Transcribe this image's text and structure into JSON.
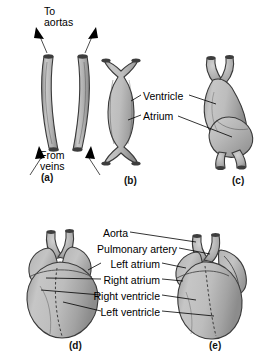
{
  "figure": {
    "type": "biology-diagram",
    "background_color": "#ffffff",
    "fill_light": "#cfcfcf",
    "fill_mid": "#b0b0b0",
    "fill_dark": "#8f8f8f",
    "outline_color": "#3a3a3a"
  },
  "panels": [
    {
      "id": "a",
      "label": "(a)",
      "caption_x": 48,
      "caption_y": 177
    },
    {
      "id": "b",
      "label": "(b)",
      "caption_x": 131,
      "caption_y": 180
    },
    {
      "id": "c",
      "label": "(c)",
      "caption_x": 239,
      "caption_y": 180
    },
    {
      "id": "d",
      "label": "(d)",
      "caption_x": 76,
      "caption_y": 345
    },
    {
      "id": "e",
      "label": "(e)",
      "caption_x": 216,
      "caption_y": 345
    }
  ],
  "panel_a": {
    "top_annotation": {
      "line1": "To",
      "line2": "aortas"
    },
    "bottom_annotation": {
      "line1": "From",
      "line2": "veins"
    }
  },
  "panel_bc_labels": [
    {
      "text": "Ventricle",
      "y": 98
    },
    {
      "text": "Atrium",
      "y": 118
    }
  ],
  "panel_de_labels": [
    {
      "text": "Aorta",
      "y": 234
    },
    {
      "text": "Pulmonary artery",
      "y": 250
    },
    {
      "text": "Left atrium",
      "y": 265
    },
    {
      "text": "Right atrium",
      "y": 281
    },
    {
      "text": "Right ventricle",
      "y": 297
    },
    {
      "text": "Left ventricle",
      "y": 313
    }
  ]
}
